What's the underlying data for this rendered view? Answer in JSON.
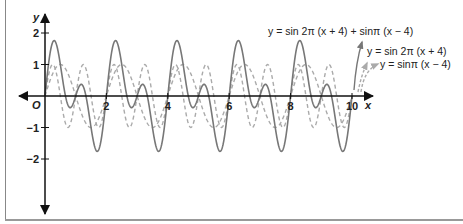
{
  "chart_data": {
    "type": "line",
    "title": "",
    "xlabel": "x",
    "ylabel": "y",
    "origin_label": "O",
    "xlim": [
      -0.8,
      10.5
    ],
    "ylim": [
      -3.7,
      2.3
    ],
    "x_ticks": [
      2,
      4,
      6,
      8,
      10
    ],
    "x_tick_labels": [
      "2",
      "4",
      "6",
      "8",
      "10"
    ],
    "y_ticks": [
      2,
      1,
      -1,
      -2
    ],
    "y_tick_labels": [
      "2",
      "1",
      "−1",
      "−2"
    ],
    "grid": false,
    "legend_position": "upper right (annotations with arrows)",
    "series": [
      {
        "name": "y = sin 2π (x + 4) + sin π (x − 4)",
        "formula": "sin(2*pi*(x+4)) + sin(pi*(x-4))",
        "style": "solid",
        "color": "#777777",
        "x_range": [
          0,
          10
        ]
      },
      {
        "name": "y = sin 2π (x + 4)",
        "formula": "sin(2*pi*(x+4))",
        "style": "dashed",
        "color": "#aaaaaa",
        "x_range": [
          0,
          10
        ]
      },
      {
        "name": "y = sin π (x − 4)",
        "formula": "sin(pi*(x-4))",
        "style": "dashed",
        "color": "#aaaaaa",
        "x_range": [
          0,
          10
        ]
      }
    ]
  },
  "labels": {
    "sum_curve": "y = sin 2π (x + 4) + sinπ (x − 4)",
    "curve_a": "y = sin 2π (x + 4)",
    "curve_b": "y = sinπ (x − 4)"
  }
}
